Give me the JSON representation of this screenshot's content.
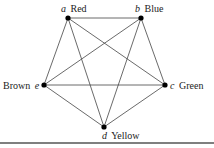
{
  "graph": {
    "type": "complete graph K5",
    "nodes": [
      {
        "id": "a",
        "color": "Red",
        "x": 68,
        "y": 18
      },
      {
        "id": "b",
        "color": "Blue",
        "x": 141,
        "y": 18
      },
      {
        "id": "c",
        "color": "Green",
        "x": 165,
        "y": 85
      },
      {
        "id": "d",
        "color": "Yellow",
        "x": 104,
        "y": 127
      },
      {
        "id": "e",
        "color": "Brown",
        "x": 44,
        "y": 85
      }
    ],
    "edges": [
      [
        "a",
        "b"
      ],
      [
        "a",
        "c"
      ],
      [
        "a",
        "d"
      ],
      [
        "a",
        "e"
      ],
      [
        "b",
        "c"
      ],
      [
        "b",
        "d"
      ],
      [
        "b",
        "e"
      ],
      [
        "c",
        "d"
      ],
      [
        "c",
        "e"
      ],
      [
        "d",
        "e"
      ]
    ]
  },
  "labels": {
    "a_var": "a",
    "a_name": "Red",
    "b_var": "b",
    "b_name": "Blue",
    "c_var": "c",
    "c_name": "Green",
    "d_var": "d",
    "d_name": "Yellow",
    "e_var": "e",
    "e_name": "Brown"
  }
}
